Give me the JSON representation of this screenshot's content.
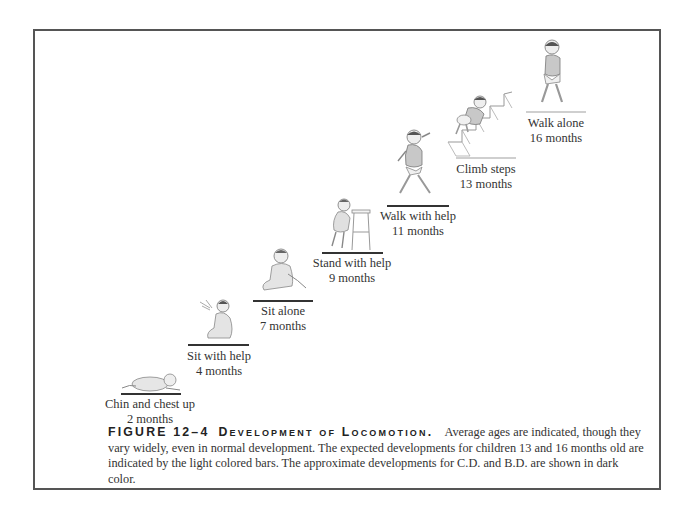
{
  "figure": {
    "number_label": "FIGURE 12–4",
    "title": "Development of Locomotion.",
    "caption_text": "Average ages are indicated, though they vary widely, even in normal development. The expected developments for children 13 and 16 months old are indicated by the light colored bars. The approximate developments for C.D. and B.D. are shown in dark color."
  },
  "stages": [
    {
      "name": "Chin and chest up",
      "age": "2 months",
      "bar": "dark",
      "icon": "baby-lying-prone-icon"
    },
    {
      "name": "Sit with help",
      "age": "4 months",
      "bar": "dark",
      "icon": "baby-sitting-supported-icon"
    },
    {
      "name": "Sit alone",
      "age": "7 months",
      "bar": "dark",
      "icon": "baby-sitting-icon"
    },
    {
      "name": "Stand with help",
      "age": "9 months",
      "bar": "dark",
      "icon": "baby-standing-stool-icon"
    },
    {
      "name": "Walk with help",
      "age": "11 months",
      "bar": "dark",
      "icon": "baby-walking-icon"
    },
    {
      "name": "Climb steps",
      "age": "13 months",
      "bar": "light",
      "icon": "baby-climbing-stairs-icon"
    },
    {
      "name": "Walk alone",
      "age": "16 months",
      "bar": "light",
      "icon": "toddler-walking-icon"
    }
  ],
  "colors": {
    "dark_bar": "#333333",
    "light_bar": "#cfcfcf",
    "frame": "#555555"
  }
}
